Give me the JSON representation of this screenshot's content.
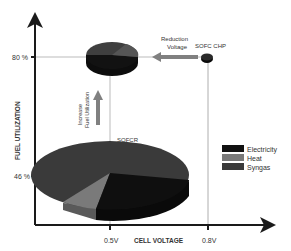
{
  "axes": {
    "y_label": "FUEL UTILIZATION",
    "x_label": "CELL VOLTAGE",
    "y_ticks": [
      "80 %",
      "46 %"
    ],
    "x_ticks": [
      "0.5V",
      "0.8V"
    ]
  },
  "annotations": {
    "reduction_line1": "Reduction",
    "reduction_line2": "Voltage",
    "sofc_chp": "SOFC CHP",
    "increase_line1": "Increase",
    "increase_line2": "Fuel Utilization",
    "sofcr": "SOFCR"
  },
  "legend": {
    "items": [
      {
        "label": "Electricity",
        "color": "#111111"
      },
      {
        "label": "Heat",
        "color": "#7a7a7a"
      },
      {
        "label": "Syngas",
        "color": "#3a3a3a"
      }
    ]
  },
  "colors": {
    "electricity": "#111111",
    "heat": "#7a7a7a",
    "syngas": "#3c3c3c",
    "axis": "#1a1a1a",
    "guide": "#999999",
    "arrow": "#808080"
  }
}
